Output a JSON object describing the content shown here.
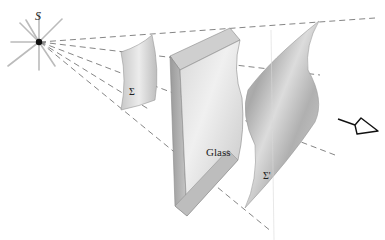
{
  "diagram": {
    "labels": {
      "source": "S",
      "wavefront_initial": "Σ",
      "glass": "Glass",
      "wavefront_final": "Σ'"
    },
    "colors": {
      "ray": "#777777",
      "surface_light": "#e4e4e4",
      "surface_dark": "#a8a8a8",
      "source": "#111111",
      "eye": "#111111"
    },
    "elements": [
      {
        "type": "point-source",
        "label": "S"
      },
      {
        "type": "wavefront",
        "label": "Σ"
      },
      {
        "type": "glass-slab",
        "label": "Glass"
      },
      {
        "type": "wavefront",
        "label": "Σ'"
      },
      {
        "type": "eye-observer"
      }
    ]
  }
}
